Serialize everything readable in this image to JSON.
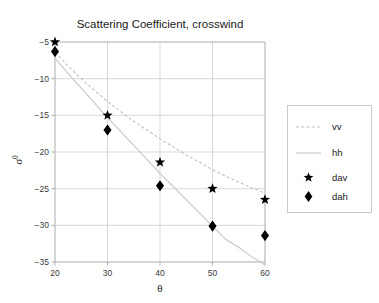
{
  "figure": {
    "width": 379,
    "height": 303,
    "background": "#ffffff"
  },
  "chart_data": {
    "type": "line",
    "title": "Scattering Coefficient, crosswind",
    "xlabel": "θ",
    "ylabel": "σ",
    "ylabel_sup": "0",
    "xlim": [
      20,
      60
    ],
    "ylim": [
      -35,
      -5
    ],
    "xticks": [
      20,
      30,
      40,
      50,
      60
    ],
    "xticklabels": [
      "20",
      "30",
      "40",
      "50",
      "60"
    ],
    "yticks": [
      -5,
      -10,
      -15,
      -20,
      -25,
      -30,
      -35
    ],
    "yticklabels": [
      "−5",
      "−10",
      "−15",
      "−20",
      "−25",
      "−30",
      "−35"
    ],
    "grid": true,
    "grid_color": "#c8c8c8",
    "legend_position": "outside-right",
    "series": [
      {
        "name": "vv",
        "kind": "line",
        "style": "dashed",
        "color": "#c0c0c0",
        "x": [
          20,
          22.5,
          25,
          27.5,
          30,
          32.5,
          35,
          37.5,
          40,
          42.5,
          45,
          47.5,
          50,
          52.5,
          55,
          57.5,
          60
        ],
        "y": [
          -6.4,
          -8.3,
          -10.0,
          -11.6,
          -13.1,
          -14.5,
          -15.8,
          -17.0,
          -18.2,
          -19.3,
          -20.4,
          -21.4,
          -22.4,
          -23.3,
          -24.1,
          -24.9,
          -25.6
        ]
      },
      {
        "name": "hh",
        "kind": "line",
        "style": "solid",
        "color": "#c6c6c6",
        "x": [
          20,
          22.5,
          25,
          27.5,
          30,
          32.5,
          35,
          37.5,
          40,
          42.5,
          45,
          47.5,
          50,
          52.5,
          55,
          57.5,
          60
        ],
        "y": [
          -7.2,
          -9.3,
          -11.3,
          -13.3,
          -15.3,
          -17.2,
          -19.1,
          -21.0,
          -22.9,
          -24.7,
          -26.5,
          -28.3,
          -30.1,
          -31.9,
          -33.0,
          -34.3,
          -35.4
        ]
      },
      {
        "name": "dav",
        "kind": "scatter",
        "marker": "star",
        "color": "#000000",
        "x": [
          20,
          30,
          40,
          50,
          60
        ],
        "y": [
          -5.0,
          -15.0,
          -21.4,
          -25.0,
          -26.5
        ]
      },
      {
        "name": "dah",
        "kind": "scatter",
        "marker": "diamond",
        "color": "#000000",
        "x": [
          20,
          30,
          40,
          50,
          60
        ],
        "y": [
          -6.3,
          -17.0,
          -24.6,
          -30.1,
          -31.4
        ]
      }
    ]
  },
  "legend": {
    "entries": [
      {
        "label": "vv",
        "type": "line",
        "style": "dashed"
      },
      {
        "label": "hh",
        "type": "line",
        "style": "solid"
      },
      {
        "label": "dav",
        "type": "marker",
        "style": "star"
      },
      {
        "label": "dah",
        "type": "marker",
        "style": "diamond"
      }
    ]
  }
}
